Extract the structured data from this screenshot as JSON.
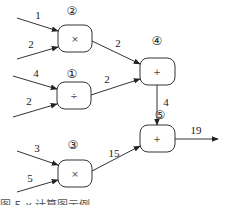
{
  "diagram": {
    "nodes": [
      {
        "id": "n2",
        "label": "②",
        "op": "×",
        "x": 58,
        "y": 25,
        "w": 34,
        "h": 27
      },
      {
        "id": "n1",
        "label": "①",
        "op": "÷",
        "x": 57,
        "y": 82,
        "w": 34,
        "h": 27
      },
      {
        "id": "n3",
        "label": "③",
        "op": "×",
        "x": 58,
        "y": 160,
        "w": 34,
        "h": 27
      },
      {
        "id": "n4",
        "label": "④",
        "op": "+",
        "x": 140,
        "y": 58,
        "w": 35,
        "h": 27
      },
      {
        "id": "n5",
        "label": "⑤",
        "op": "+",
        "x": 140,
        "y": 125,
        "w": 35,
        "h": 27
      }
    ],
    "inputs": [
      {
        "value": "1",
        "to": "n2"
      },
      {
        "value": "2",
        "to": "n2"
      },
      {
        "value": "4",
        "to": "n1"
      },
      {
        "value": "2",
        "to": "n1"
      },
      {
        "value": "3",
        "to": "n3"
      },
      {
        "value": "5",
        "to": "n3"
      }
    ],
    "edges": [
      {
        "from": "n2",
        "to": "n4",
        "value": "2"
      },
      {
        "from": "n1",
        "to": "n4",
        "value": "2"
      },
      {
        "from": "n4",
        "to": "n5",
        "value": "4"
      },
      {
        "from": "n3",
        "to": "n5",
        "value": "15"
      }
    ],
    "output": {
      "from": "n5",
      "value": "19"
    },
    "caption": "图 5-x  计算图示例"
  }
}
